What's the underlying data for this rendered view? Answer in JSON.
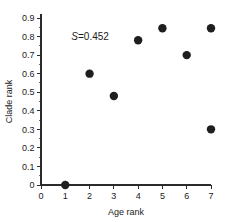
{
  "chart_data": {
    "type": "scatter",
    "title": "",
    "xlabel": "Age rank",
    "ylabel": "Clade rank",
    "xlim": [
      0,
      7
    ],
    "ylim": [
      0,
      0.9
    ],
    "grid": false,
    "legend": null,
    "x_ticks": [
      "0",
      "1",
      "2",
      "3",
      "4",
      "5",
      "6",
      "7"
    ],
    "x_tick_values": [
      0,
      1,
      2,
      3,
      4,
      5,
      6,
      7
    ],
    "y_ticks": [
      "0",
      "0.1",
      "0.2",
      "0.3",
      "0.4",
      "0.5",
      "0.6",
      "0.7",
      "0.8",
      "0.9"
    ],
    "y_tick_values": [
      0,
      0.1,
      0.2,
      0.3,
      0.4,
      0.5,
      0.6,
      0.7,
      0.8,
      0.9
    ],
    "points": [
      {
        "x": 1,
        "y": 0.0
      },
      {
        "x": 2,
        "y": 0.6
      },
      {
        "x": 3,
        "y": 0.48
      },
      {
        "x": 4,
        "y": 0.78
      },
      {
        "x": 5,
        "y": 0.845
      },
      {
        "x": 6,
        "y": 0.7
      },
      {
        "x": 7,
        "y": 0.845
      },
      {
        "x": 7,
        "y": 0.3
      }
    ],
    "marker_color": "#1f1f1f",
    "marker_size": 5.2,
    "annotations": [
      {
        "symbol": "S",
        "text": "=0.452",
        "x": 1.25,
        "y": 0.8
      }
    ]
  }
}
